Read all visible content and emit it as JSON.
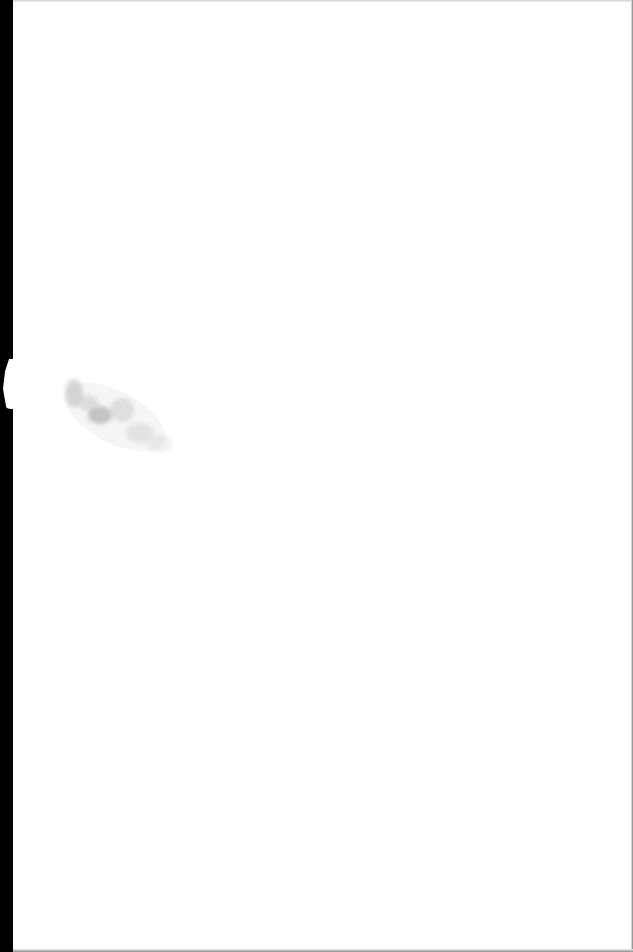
{
  "document": {
    "type": "scanned-page",
    "content": "",
    "colors": {
      "paper": "#ffffff",
      "scan_edge": "#000000",
      "smudge": "#9a9a9a"
    }
  }
}
